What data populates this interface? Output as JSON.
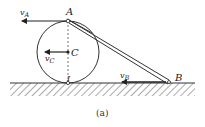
{
  "figure": {
    "caption": "(a)",
    "points": {
      "A": "A",
      "C": "C",
      "I": "I",
      "B": "B"
    },
    "vectors": {
      "vA": {
        "symbol": "v",
        "subscript": "A"
      },
      "vC": {
        "symbol": "v",
        "subscript": "C"
      },
      "vB": {
        "symbol": "v",
        "subscript": "B"
      }
    },
    "colors": {
      "line": "#333333",
      "hatch": "#555555",
      "background": "#ffffff"
    }
  }
}
